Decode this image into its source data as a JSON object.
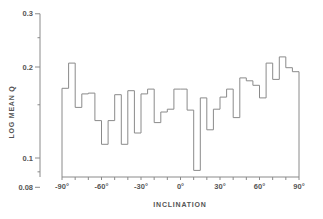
{
  "chart_data": {
    "type": "bar",
    "style": "step-histogram",
    "title": "",
    "xlabel": "INCLINATION",
    "ylabel": "LOG MEAN Q",
    "yscale": "log",
    "ylim": [
      0.08,
      0.3
    ],
    "xlim": [
      -90,
      90
    ],
    "grid": false,
    "legend": null,
    "bin_width_deg": 5,
    "x_ticks": [
      {
        "value": -90,
        "label": "-90°"
      },
      {
        "value": -60,
        "label": "-60°"
      },
      {
        "value": -30,
        "label": "-30°"
      },
      {
        "value": 0,
        "label": "0°"
      },
      {
        "value": 30,
        "label": "30°"
      },
      {
        "value": 60,
        "label": "60°"
      },
      {
        "value": 90,
        "label": "90°"
      }
    ],
    "y_ticks": [
      {
        "value": 0.3,
        "label": "0.3"
      },
      {
        "value": 0.2,
        "label": "0.2"
      },
      {
        "value": 0.1,
        "label": "0.1"
      },
      {
        "value": 0.08,
        "label": "0.08"
      }
    ],
    "y_minor_ticks": [
      0.25,
      0.15,
      0.09
    ],
    "categories": [
      -87.5,
      -82.5,
      -77.5,
      -72.5,
      -67.5,
      -62.5,
      -57.5,
      -52.5,
      -47.5,
      -42.5,
      -37.5,
      -32.5,
      -27.5,
      -22.5,
      -17.5,
      -12.5,
      -7.5,
      -2.5,
      2.5,
      7.5,
      12.5,
      17.5,
      22.5,
      27.5,
      32.5,
      37.5,
      42.5,
      47.5,
      52.5,
      57.5,
      62.5,
      67.5,
      72.5,
      77.5,
      82.5,
      87.5
    ],
    "values": [
      0.17,
      0.206,
      0.147,
      0.163,
      0.164,
      0.133,
      0.111,
      0.133,
      0.162,
      0.111,
      0.167,
      0.121,
      0.163,
      0.169,
      0.131,
      0.142,
      0.145,
      0.169,
      0.169,
      0.144,
      0.091,
      0.158,
      0.124,
      0.145,
      0.159,
      0.169,
      0.136,
      0.184,
      0.18,
      0.174,
      0.158,
      0.206,
      0.182,
      0.216,
      0.199,
      0.193
    ]
  }
}
